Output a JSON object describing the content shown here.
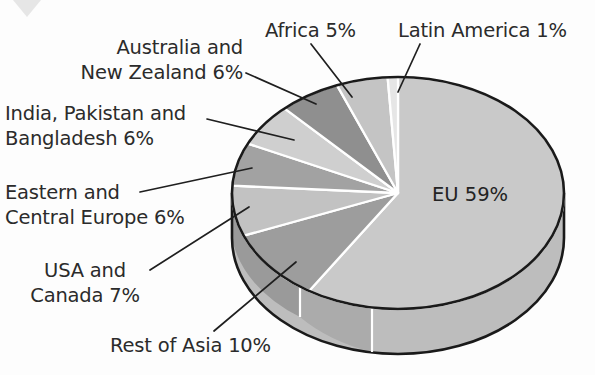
{
  "figure": {
    "background_color": "#fdfdfd",
    "outline_color": "#1a1a1a",
    "divider_color": "#ffffff",
    "label_color": "#2b2b2b",
    "leader_color": "#1f1f1f",
    "corner_marker": "down-triangle-marker"
  },
  "chart_data": {
    "type": "pie",
    "title": "",
    "subtitle": "",
    "xlabel": "",
    "ylabel": "",
    "style": "3d-exploded-disc",
    "grid": false,
    "legend_position": "none",
    "value_unit": "%",
    "total": 100,
    "start_angle_deg": 0,
    "direction": "clockwise",
    "categories": [
      "EU",
      "Rest of Asia",
      "USA and Canada",
      "Eastern and Central Europe",
      "India, Pakistan and Bangladesh",
      "Australia and New Zealand",
      "Africa",
      "Latin America"
    ],
    "values": [
      59,
      10,
      7,
      6,
      6,
      6,
      5,
      1
    ],
    "slice_colors": [
      "#c9c9c9",
      "#9d9d9d",
      "#c2c2c2",
      "#a2a2a2",
      "#cfcfcf",
      "#8f8f8f",
      "#c4c4c4",
      "#e6e6e6"
    ],
    "labels": [
      "EU 59%",
      "Rest of Asia 10%",
      "USA and Canada 7%",
      "Eastern and Central Europe 6%",
      "India, Pakistan and Bangladesh 6%",
      "Australia and New Zealand 6%",
      "Africa 5%",
      "Latin America 1%"
    ]
  },
  "callouts": {
    "eu": {
      "text": "EU 59%"
    },
    "africa": {
      "text": "Africa 5%"
    },
    "latin_america": {
      "text": "Latin America 1%"
    },
    "australia_nz": {
      "line1": "Australia and",
      "line2": "New Zealand 6%"
    },
    "india_pak_bang": {
      "line1": "India, Pakistan and",
      "line2": "Bangladesh 6%"
    },
    "eastern_central_europe": {
      "line1": "Eastern and",
      "line2": "Central Europe 6%"
    },
    "usa_canada": {
      "line1": "USA and",
      "line2": "Canada 7%"
    },
    "rest_of_asia": {
      "text": "Rest of Asia 10%"
    }
  }
}
